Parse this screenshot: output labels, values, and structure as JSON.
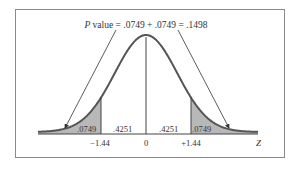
{
  "figure": {
    "title_italic": "P",
    "title_rest": " value = .0749 + .0749 = .1498",
    "axis_label": "Z",
    "tick_labels": [
      "−1.44",
      "0",
      "+1.44"
    ],
    "area_labels": {
      "left_tail": ".0749",
      "left_center": ".4251",
      "right_center": ".4251",
      "right_tail": ".0749"
    },
    "colors": {
      "frame": "#8a8a8a",
      "curve": "#555555",
      "shade": "#b8b8b8",
      "text": "#333333"
    }
  },
  "chart_data": {
    "type": "area",
    "title": "P value = .0749 + .0749 = .1498",
    "xlabel": "Z",
    "ylabel": "",
    "distribution": "standard normal",
    "x_ticks": [
      -1.44,
      0,
      1.44
    ],
    "shaded_regions": [
      {
        "from": "-inf",
        "to": -1.44,
        "area": 0.0749
      },
      {
        "from": 1.44,
        "to": "inf",
        "area": 0.0749
      }
    ],
    "unshaded_regions": [
      {
        "from": -1.44,
        "to": 0,
        "area": 0.4251
      },
      {
        "from": 0,
        "to": 1.44,
        "area": 0.4251
      }
    ],
    "p_value": 0.1498,
    "grid": false,
    "legend": null
  }
}
